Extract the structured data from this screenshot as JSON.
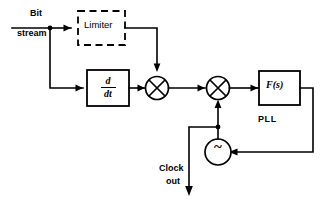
{
  "figure": {
    "type": "block-diagram",
    "title_visible": false,
    "background_color": "#ffffff",
    "line_color": "#000000"
  },
  "labels": {
    "bit": "Bit",
    "stream": "stream",
    "limiter": "Limiter",
    "pll": "PLL",
    "clock": "Clock",
    "out": "out",
    "loop_filter": "F(s)",
    "differentiator_numerator": "d",
    "differentiator_denominator": "dt",
    "vco_symbol": "~"
  },
  "blocks": [
    {
      "id": "limiter",
      "label": "Limiter",
      "shape": "dashed-rectangle",
      "note": "dashed outline block"
    },
    {
      "id": "differentiator",
      "label": "d/dt",
      "shape": "rectangle",
      "note": "solid outline block containing derivative operator"
    },
    {
      "id": "mixer-1",
      "label": "",
      "shape": "circle-with-x",
      "note": "multiplier / mixer"
    },
    {
      "id": "mixer-2",
      "label": "",
      "shape": "circle-with-x",
      "note": "phase detector multiplier"
    },
    {
      "id": "loop-filter",
      "label": "F(s)",
      "shape": "rectangle",
      "note": "PLL loop filter"
    },
    {
      "id": "vco",
      "label": "~",
      "shape": "circle",
      "note": "voltage controlled oscillator"
    }
  ],
  "signals": [
    {
      "id": "input",
      "label": "Bit stream",
      "direction": "in"
    },
    {
      "id": "output",
      "label": "Clock out",
      "direction": "out"
    }
  ],
  "annotations": [
    {
      "id": "pll-group",
      "label": "PLL"
    }
  ]
}
